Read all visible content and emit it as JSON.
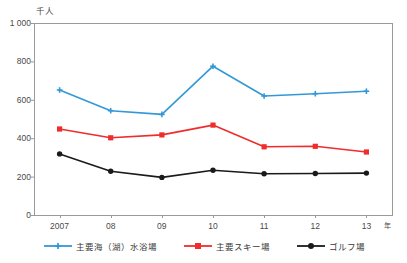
{
  "chart_data": {
    "type": "line",
    "title": "",
    "xlabel": "年",
    "ylabel": "千人",
    "unit_note": "千人",
    "categories": [
      "2007",
      "08",
      "09",
      "10",
      "11",
      "12",
      "13"
    ],
    "x_axis_unit": "年",
    "ylim": [
      0,
      1000
    ],
    "y_ticks": [
      "0",
      "200",
      "400",
      "600",
      "800",
      "1 000"
    ],
    "y_tick_values": [
      0,
      200,
      400,
      600,
      800,
      1000
    ],
    "grid": false,
    "legend_position": "bottom",
    "series": [
      {
        "name": "主要海（湖）水浴場",
        "color": "#3399d6",
        "marker": "cross",
        "values": [
          651,
          543,
          524,
          775,
          620,
          632,
          645
        ]
      },
      {
        "name": "主要スキー場",
        "color": "#ef2d2d",
        "marker": "square",
        "values": [
          448,
          402,
          417,
          468,
          355,
          358,
          328
        ]
      },
      {
        "name": "ゴルフ場",
        "color": "#1a1a1a",
        "marker": "circle",
        "values": [
          318,
          228,
          196,
          233,
          215,
          216,
          218
        ]
      }
    ]
  },
  "axis": {
    "line_color": "#9a9a9a",
    "text_color": "#4a4a4a"
  },
  "plot": {
    "left": 34,
    "right": 392,
    "top": 23,
    "bottom": 215
  }
}
